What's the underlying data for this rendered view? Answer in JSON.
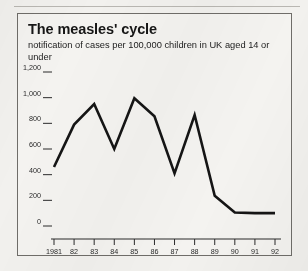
{
  "figure": {
    "title": "The measles' cycle",
    "subtitle": "notification of cases per 100,000 children in UK aged 14 or under"
  },
  "chart_data": {
    "type": "line",
    "title": "The measles' cycle",
    "subtitle": "notification of cases per 100,000 children in UK aged 14 or under",
    "xlabel": "",
    "ylabel": "",
    "categories": [
      "1981",
      "82",
      "83",
      "84",
      "85",
      "86",
      "87",
      "88",
      "89",
      "90",
      "91",
      "92"
    ],
    "x": [
      1981,
      1982,
      1983,
      1984,
      1985,
      1986,
      1987,
      1988,
      1989,
      1990,
      1991,
      1992
    ],
    "values": [
      460,
      790,
      950,
      600,
      995,
      855,
      410,
      865,
      235,
      105,
      100,
      100
    ],
    "series": [
      {
        "name": "notifications per 100,000 children aged 14 or under",
        "values": [
          460,
          790,
          950,
          600,
          995,
          855,
          410,
          865,
          235,
          105,
          100,
          100
        ]
      }
    ],
    "ylim": [
      0,
      1200
    ],
    "yticks": [
      0,
      200,
      400,
      600,
      800,
      1000,
      1200
    ],
    "ytick_labels": [
      "0",
      "200",
      "400",
      "600",
      "800",
      "1,000",
      "1,200"
    ],
    "grid": false,
    "legend": null,
    "line_color": "#151515",
    "background_color": "#f4f3f0"
  }
}
